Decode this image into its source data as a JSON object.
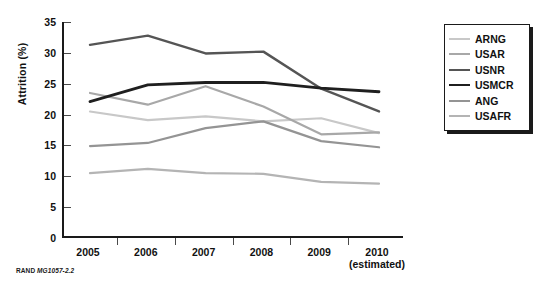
{
  "caption": {
    "org": "RAND",
    "code": "MG1057-2.2"
  },
  "legend": {
    "position": "right",
    "items": [
      {
        "label": "ARNG",
        "color": "#c8c8c8",
        "width": 2.2
      },
      {
        "label": "USAR",
        "color": "#a8a8a8",
        "width": 2.2
      },
      {
        "label": "USNR",
        "color": "#555555",
        "width": 2.4
      },
      {
        "label": "USMCR",
        "color": "#1f1f1f",
        "width": 2.8
      },
      {
        "label": "ANG",
        "color": "#949494",
        "width": 2.2
      },
      {
        "label": "USAFR",
        "color": "#b4b4b4",
        "width": 2.2
      }
    ]
  },
  "chart_data": {
    "type": "line",
    "title": "",
    "xlabel": "",
    "ylabel": "Attrition (%)",
    "categories": [
      "2005",
      "2006",
      "2007",
      "2008",
      "2009",
      "2010"
    ],
    "x_sublabels": [
      "",
      "",
      "",
      "",
      "",
      "(estimated)"
    ],
    "xlim": [
      0,
      5
    ],
    "ylim": [
      0,
      35
    ],
    "yticks": [
      0,
      5,
      10,
      15,
      20,
      25,
      30,
      35
    ],
    "ytick_labels": [
      "0",
      "5",
      "10",
      "15",
      "20",
      "25",
      "30",
      "35"
    ],
    "grid": false,
    "series": [
      {
        "name": "ARNG",
        "color": "#c8c8c8",
        "width": 2.2,
        "values": [
          20.5,
          19.1,
          19.7,
          18.9,
          19.4,
          17.0
        ]
      },
      {
        "name": "USAR",
        "color": "#a8a8a8",
        "width": 2.2,
        "values": [
          23.5,
          21.6,
          24.6,
          21.3,
          16.8,
          17.1
        ]
      },
      {
        "name": "USNR",
        "color": "#555555",
        "width": 2.4,
        "values": [
          31.3,
          32.8,
          29.9,
          30.2,
          24.2,
          20.5
        ]
      },
      {
        "name": "USMCR",
        "color": "#1f1f1f",
        "width": 2.8,
        "values": [
          22.1,
          24.8,
          25.2,
          25.2,
          24.3,
          23.7
        ]
      },
      {
        "name": "ANG",
        "color": "#949494",
        "width": 2.2,
        "values": [
          14.9,
          15.4,
          17.8,
          18.9,
          15.7,
          14.7
        ]
      },
      {
        "name": "USAFR",
        "color": "#b4b4b4",
        "width": 2.2,
        "values": [
          10.5,
          11.2,
          10.5,
          10.4,
          9.1,
          8.8
        ]
      }
    ]
  }
}
